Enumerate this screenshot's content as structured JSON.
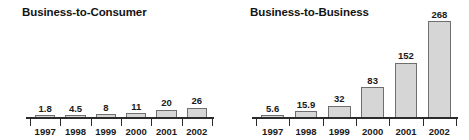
{
  "figure": {
    "background": "#ffffff",
    "bar_fill": "#d6d6d6",
    "bar_border": "#6e6e6e",
    "axis_color": "#2b2b2b",
    "text_color": "#1a1a1a"
  },
  "chart_data": [
    {
      "type": "bar",
      "title": "Business-to-Consumer",
      "categories": [
        "1997",
        "1998",
        "1999",
        "2000",
        "2001",
        "2002"
      ],
      "values": [
        1.8,
        4.5,
        8,
        11,
        20,
        26
      ],
      "value_labels": [
        "1.8",
        "4.5",
        "8",
        "11",
        "20",
        "26"
      ],
      "xlabel": "",
      "ylabel": "",
      "ylim": [
        0,
        280
      ],
      "grid": false,
      "legend": "none",
      "axis": "baseline-only"
    },
    {
      "type": "bar",
      "title": "Business-to-Business",
      "categories": [
        "1997",
        "1998",
        "1999",
        "2000",
        "2001",
        "2002"
      ],
      "values": [
        5.6,
        15.9,
        32,
        83,
        152,
        268
      ],
      "value_labels": [
        "5.6",
        "15.9",
        "32",
        "83",
        "152",
        "268"
      ],
      "xlabel": "",
      "ylabel": "",
      "ylim": [
        0,
        280
      ],
      "grid": false,
      "legend": "none",
      "axis": "baseline-only"
    }
  ]
}
